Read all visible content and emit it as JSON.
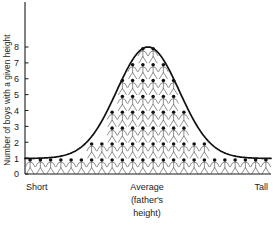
{
  "chart_data": {
    "type": "bar",
    "title": "",
    "subtitle": "",
    "xlabel": "Average (father's height)",
    "ylabel": "Number of boys with a given height",
    "ylim": [
      0,
      8
    ],
    "y_ticks": [
      0,
      1,
      2,
      3,
      4,
      5,
      6,
      7,
      8
    ],
    "grid": false,
    "legend": null,
    "x_category_labels": [
      "Short",
      "Average",
      "(father's",
      "height)",
      "Tall"
    ],
    "x_axis_left_label": "Short",
    "x_axis_center_label_line1": "Average",
    "x_axis_center_label_line2": "(father's",
    "x_axis_center_label_line3": "height)",
    "x_axis_right_label": "Tall",
    "unit_symbol": "stick-figure boy",
    "overlay": "normal bell curve",
    "categories": [
      "1",
      "2",
      "3",
      "4",
      "5",
      "6",
      "7",
      "8",
      "9",
      "10",
      "11",
      "12",
      "13",
      "14",
      "15",
      "16",
      "17",
      "18",
      "19",
      "20",
      "21",
      "22",
      "23",
      "24"
    ],
    "values": [
      1,
      1,
      1,
      1,
      1,
      1,
      2,
      2,
      4,
      6,
      7,
      8,
      8,
      7,
      6,
      4,
      2,
      2,
      1,
      1,
      1,
      1,
      1,
      1
    ]
  },
  "axes": {
    "y_axis_label": "Number of boys with a given height",
    "y_tick_labels": [
      "0",
      "1",
      "2",
      "3",
      "4",
      "5",
      "6",
      "7",
      "8"
    ],
    "x_left": "Short",
    "x_center_l1": "Average",
    "x_center_l2": "(father's",
    "x_center_l3": "height)",
    "x_right": "Tall"
  },
  "colors": {
    "axis": "#1a1a1a",
    "curve": "#111111",
    "figure_stroke": "#4a4a4a",
    "figure_head": "#111111",
    "background": "#ffffff"
  }
}
